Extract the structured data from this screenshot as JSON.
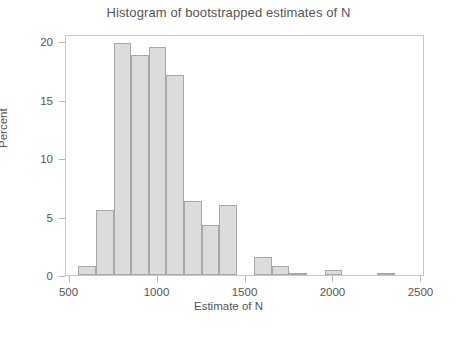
{
  "chart_data": {
    "type": "bar",
    "title": "Histogram of bootstrapped estimates of N",
    "xlabel": "Estimate of N",
    "ylabel": "Percent",
    "xlim": [
      480,
      2520
    ],
    "ylim": [
      0,
      20.6
    ],
    "xticks": [
      500,
      1000,
      1500,
      2000,
      2500
    ],
    "yticks": [
      0,
      5,
      10,
      15,
      20
    ],
    "grid": false,
    "legend": null,
    "bin_width": 100,
    "bars": [
      {
        "bin_start": 550,
        "bin_end": 650,
        "value": 0.8
      },
      {
        "bin_start": 650,
        "bin_end": 750,
        "value": 5.6
      },
      {
        "bin_start": 750,
        "bin_end": 850,
        "value": 19.8
      },
      {
        "bin_start": 850,
        "bin_end": 950,
        "value": 18.8
      },
      {
        "bin_start": 950,
        "bin_end": 1050,
        "value": 19.5
      },
      {
        "bin_start": 1050,
        "bin_end": 1150,
        "value": 17.1
      },
      {
        "bin_start": 1150,
        "bin_end": 1250,
        "value": 6.3
      },
      {
        "bin_start": 1250,
        "bin_end": 1350,
        "value": 4.3
      },
      {
        "bin_start": 1350,
        "bin_end": 1450,
        "value": 6.0
      },
      {
        "bin_start": 1550,
        "bin_end": 1650,
        "value": 1.5
      },
      {
        "bin_start": 1650,
        "bin_end": 1750,
        "value": 0.8
      },
      {
        "bin_start": 1750,
        "bin_end": 1850,
        "value": 0.15
      },
      {
        "bin_start": 1950,
        "bin_end": 2050,
        "value": 0.4
      },
      {
        "bin_start": 2250,
        "bin_end": 2350,
        "value": 0.12
      }
    ],
    "colors": {
      "bar_fill": "#dcdcdc",
      "bar_edge": "#a8a8a8",
      "axis": "#b5b5b5",
      "text": "#555555",
      "background": "#ffffff"
    }
  }
}
